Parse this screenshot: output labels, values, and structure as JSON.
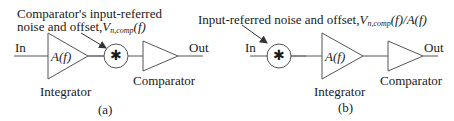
{
  "diagram": {
    "panel_a": {
      "caption": "(a)",
      "annotation_line1": "Comparator's input-referred",
      "annotation_line2_prefix": "noise and offset,",
      "annotation_symbol": "V",
      "annotation_subscript": "n,comp",
      "annotation_suffix": "(f)",
      "input_label": "In",
      "output_label": "Out",
      "integrator_gain": "A(f)",
      "integrator_label": "Integrator",
      "summer_symbol": "✱",
      "comparator_label": "Comparator",
      "order": [
        "In",
        "Integrator A(f)",
        "Noise summer",
        "Comparator",
        "Out"
      ]
    },
    "panel_b": {
      "caption": "(b)",
      "annotation_prefix": "Input-referred noise and offset,",
      "annotation_symbol": "V",
      "annotation_subscript": "n,comp",
      "annotation_suffix": "(f)/A(f)",
      "input_label": "In",
      "output_label": "Out",
      "integrator_gain": "A(f)",
      "integrator_label": "Integrator",
      "summer_symbol": "✱",
      "comparator_label": "Comparator",
      "order": [
        "In",
        "Noise summer",
        "Integrator A(f)",
        "Comparator",
        "Out"
      ]
    },
    "colors": {
      "stroke": "#555555",
      "text": "#1a1a1a",
      "background": "#ffffff"
    }
  }
}
